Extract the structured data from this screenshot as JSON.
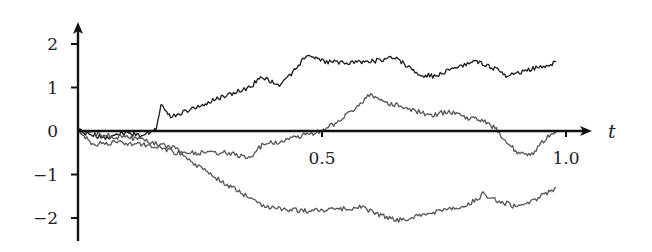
{
  "chart_data": {
    "type": "line",
    "title": "",
    "xlabel": "t",
    "ylabel": "",
    "xlim": [
      0,
      1.0
    ],
    "ylim": [
      -2.4,
      2.5
    ],
    "grid": false,
    "legend": null,
    "x_ticks": [
      {
        "value": 0.5,
        "label": "0.5"
      },
      {
        "value": 1.0,
        "label": "1.0"
      }
    ],
    "y_ticks": [
      {
        "value": 2,
        "label": "2"
      },
      {
        "value": 1,
        "label": "1"
      },
      {
        "value": 0,
        "label": "0"
      },
      {
        "value": -1,
        "label": "−1"
      },
      {
        "value": -2,
        "label": "−2"
      }
    ],
    "series": [
      {
        "name": "path-1",
        "color": "#1a1a1a",
        "t": [
          0,
          0.05,
          0.1,
          0.13,
          0.16,
          0.17,
          0.19,
          0.2,
          0.24,
          0.3,
          0.35,
          0.38,
          0.41,
          0.44,
          0.47,
          0.5,
          0.55,
          0.6,
          0.65,
          0.7,
          0.73,
          0.77,
          0.82,
          0.86,
          0.88,
          0.92,
          0.96,
          0.98
        ],
        "values": [
          0,
          -0.15,
          -0.05,
          -0.1,
          0.05,
          0.6,
          0.35,
          0.35,
          0.55,
          0.8,
          1.0,
          1.25,
          1.05,
          1.35,
          1.75,
          1.6,
          1.55,
          1.6,
          1.7,
          1.3,
          1.25,
          1.45,
          1.6,
          1.4,
          1.25,
          1.4,
          1.5,
          1.6
        ]
      },
      {
        "name": "path-2",
        "color": "#555555",
        "t": [
          0,
          0.03,
          0.08,
          0.12,
          0.16,
          0.2,
          0.25,
          0.3,
          0.35,
          0.38,
          0.42,
          0.46,
          0.5,
          0.53,
          0.56,
          0.6,
          0.63,
          0.67,
          0.72,
          0.76,
          0.8,
          0.84,
          0.86,
          0.9,
          0.93,
          0.96,
          0.98
        ],
        "values": [
          0,
          -0.3,
          -0.25,
          -0.3,
          -0.35,
          -0.5,
          -0.5,
          -0.5,
          -0.6,
          -0.3,
          -0.25,
          -0.1,
          0.0,
          0.2,
          0.45,
          0.85,
          0.65,
          0.55,
          0.35,
          0.45,
          0.3,
          0.2,
          0.0,
          -0.5,
          -0.55,
          -0.15,
          -0.05
        ]
      },
      {
        "name": "path-3",
        "color": "#555555",
        "t": [
          0,
          0.05,
          0.1,
          0.15,
          0.2,
          0.25,
          0.3,
          0.34,
          0.38,
          0.42,
          0.48,
          0.52,
          0.58,
          0.62,
          0.66,
          0.7,
          0.75,
          0.8,
          0.83,
          0.86,
          0.9,
          0.94,
          0.98
        ],
        "values": [
          0,
          -0.1,
          -0.15,
          -0.25,
          -0.4,
          -0.85,
          -1.2,
          -1.45,
          -1.75,
          -1.8,
          -1.85,
          -1.8,
          -1.75,
          -1.95,
          -2.05,
          -1.95,
          -1.8,
          -1.7,
          -1.45,
          -1.6,
          -1.75,
          -1.55,
          -1.3
        ]
      }
    ]
  },
  "axes": {
    "x_axis_label": "t",
    "origin_label": "0"
  }
}
